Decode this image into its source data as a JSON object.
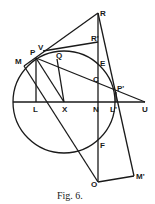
{
  "figure": {
    "caption": "Fig. 6.",
    "points": [
      {
        "id": "R",
        "label": "R"
      },
      {
        "id": "R1",
        "label": "R'"
      },
      {
        "id": "V",
        "label": "V"
      },
      {
        "id": "P",
        "label": "P"
      },
      {
        "id": "M",
        "label": "M"
      },
      {
        "id": "Q",
        "label": "Q"
      },
      {
        "id": "E",
        "label": "E"
      },
      {
        "id": "C",
        "label": "C"
      },
      {
        "id": "P1",
        "label": "P'"
      },
      {
        "id": "N",
        "label": "N"
      },
      {
        "id": "L",
        "label": "L"
      },
      {
        "id": "X",
        "label": "X"
      },
      {
        "id": "L1",
        "label": "L'"
      },
      {
        "id": "U",
        "label": "U"
      },
      {
        "id": "F",
        "label": "F"
      },
      {
        "id": "O",
        "label": "O"
      },
      {
        "id": "M1",
        "label": "M'"
      }
    ],
    "segments": [
      [
        "R",
        "O"
      ],
      [
        "L_left",
        "U"
      ],
      [
        "V",
        "R"
      ],
      [
        "V",
        "R1"
      ],
      [
        "P",
        "L"
      ],
      [
        "P",
        "X"
      ],
      [
        "Q",
        "X"
      ],
      [
        "P",
        "U"
      ],
      [
        "M",
        "O"
      ],
      [
        "R",
        "M1"
      ],
      [
        "O",
        "M1"
      ],
      [
        "P1",
        "L1"
      ]
    ]
  }
}
